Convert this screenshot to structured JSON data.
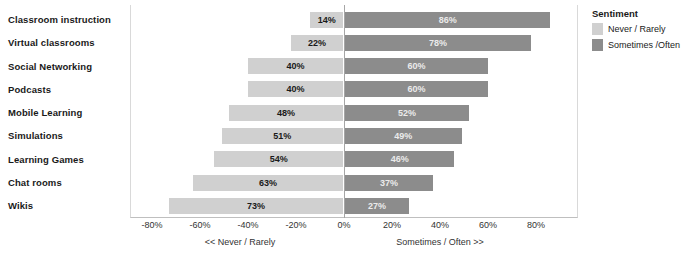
{
  "chart_data": {
    "type": "bar",
    "title": "",
    "xlabel": "",
    "ylabel": "",
    "orientation": "horizontal",
    "layout": "diverging",
    "grid": false,
    "legend_position": "right",
    "xlim": [
      -90,
      90
    ],
    "xticks": [
      "-80%",
      "-60%",
      "-40%",
      "-20%",
      "0%",
      "20%",
      "40%",
      "60%",
      "80%"
    ],
    "xtick_values": [
      -80,
      -60,
      -40,
      -20,
      0,
      20,
      40,
      60,
      80
    ],
    "categories": [
      "Classroom instruction",
      "Virtual classrooms",
      "Social Networking",
      "Podcasts",
      "Mobile Learning",
      "Simulations",
      "Learning Games",
      "Chat rooms",
      "Wikis"
    ],
    "series": [
      {
        "name": "Never / Rarely",
        "color": "#d0d0d0",
        "values": [
          14,
          22,
          40,
          40,
          48,
          51,
          54,
          63,
          73
        ],
        "labels": [
          "14%",
          "22%",
          "40%",
          "40%",
          "48%",
          "51%",
          "54%",
          "63%",
          "73%"
        ]
      },
      {
        "name": "Sometimes /Often",
        "color": "#8c8c8c",
        "values": [
          86,
          78,
          60,
          60,
          52,
          49,
          46,
          37,
          27
        ],
        "labels": [
          "86%",
          "78%",
          "60%",
          "60%",
          "52%",
          "49%",
          "46%",
          "37%",
          "27%"
        ]
      }
    ],
    "annotations": [
      "<< Never / Rarely",
      "Sometimes / Often >>"
    ]
  },
  "legend": {
    "title": "Sentiment",
    "items": [
      {
        "label": "Never / Rarely",
        "color": "#d0d0d0"
      },
      {
        "label": "Sometimes /Often",
        "color": "#8c8c8c"
      }
    ]
  },
  "axis": {
    "left_caption": "<< Never / Rarely",
    "right_caption": "Sometimes / Often >>"
  }
}
